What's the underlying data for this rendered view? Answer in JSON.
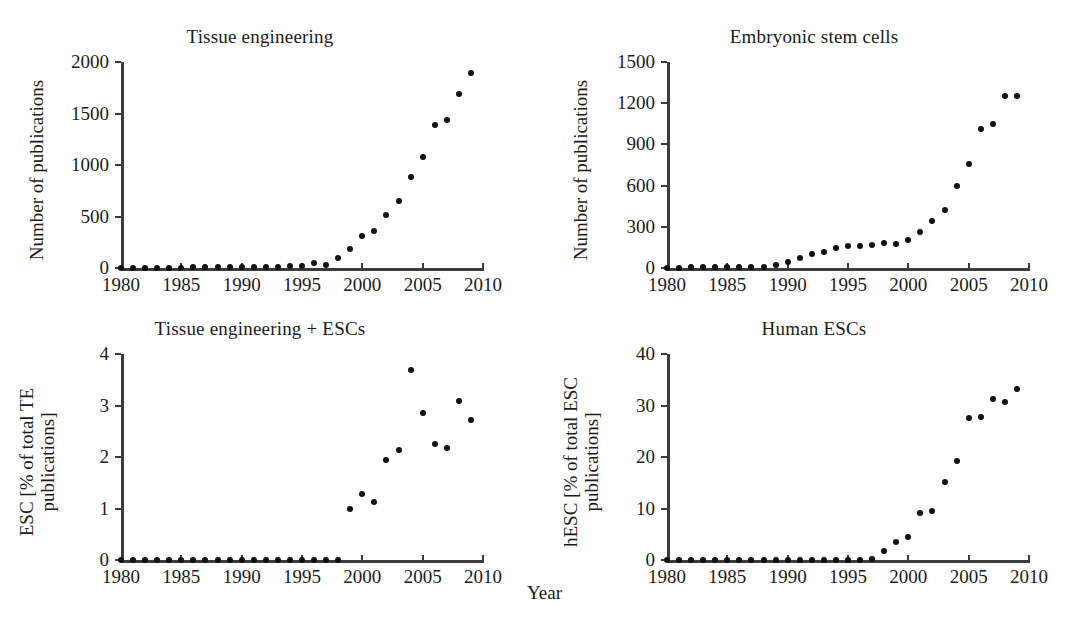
{
  "figure": {
    "shared_xlabel": "Year",
    "background_color": "#ffffff",
    "marker_color": "#111111",
    "axis_color": "#3b3b3b"
  },
  "chart_data": [
    {
      "type": "scatter",
      "panel": "top-left",
      "title": "Tissue engineering",
      "xlabel": "Year",
      "ylabel": "Number of publications",
      "xlim": [
        1980,
        2010
      ],
      "ylim": [
        0,
        2000
      ],
      "xticks": [
        1980,
        1985,
        1990,
        1995,
        2000,
        2005,
        2010
      ],
      "yticks": [
        0,
        500,
        1000,
        1500,
        2000
      ],
      "xticklabels": [
        "1980",
        "1985",
        "1990",
        "1995",
        "2000",
        "2005",
        "2010"
      ],
      "yticklabels": [
        "0",
        "500",
        "1000",
        "1500",
        "2000"
      ],
      "grid": false,
      "legend": false,
      "x": [
        1980,
        1981,
        1982,
        1983,
        1984,
        1985,
        1986,
        1987,
        1988,
        1989,
        1990,
        1991,
        1992,
        1993,
        1994,
        1995,
        1996,
        1997,
        1998,
        1999,
        2000,
        2001,
        2002,
        2003,
        2004,
        2005,
        2006,
        2007,
        2008,
        2009
      ],
      "y": [
        2,
        2,
        3,
        3,
        4,
        4,
        5,
        5,
        6,
        7,
        8,
        9,
        11,
        13,
        16,
        20,
        46,
        30,
        95,
        180,
        310,
        360,
        510,
        650,
        880,
        1080,
        1390,
        1440,
        1690,
        1890
      ]
    },
    {
      "type": "scatter",
      "panel": "top-right",
      "title": "Embryonic stem cells",
      "xlabel": "Year",
      "ylabel": "Number of publications",
      "xlim": [
        1980,
        2010
      ],
      "ylim": [
        0,
        1500
      ],
      "xticks": [
        1980,
        1985,
        1990,
        1995,
        2000,
        2005,
        2010
      ],
      "yticks": [
        0,
        300,
        600,
        900,
        1200,
        1500
      ],
      "xticklabels": [
        "1980",
        "1985",
        "1990",
        "1995",
        "2000",
        "2005",
        "2010"
      ],
      "yticklabels": [
        "0",
        "300",
        "600",
        "900",
        "1200",
        "1500"
      ],
      "grid": false,
      "legend": false,
      "x": [
        1980,
        1981,
        1982,
        1983,
        1984,
        1985,
        1986,
        1987,
        1988,
        1989,
        1990,
        1991,
        1992,
        1993,
        1994,
        1995,
        1996,
        1997,
        1998,
        1999,
        2000,
        2001,
        2002,
        2003,
        2004,
        2005,
        2006,
        2007,
        2008,
        2009
      ],
      "y": [
        3,
        3,
        4,
        4,
        5,
        5,
        6,
        7,
        8,
        25,
        45,
        75,
        100,
        115,
        148,
        160,
        162,
        170,
        180,
        178,
        205,
        265,
        340,
        425,
        600,
        760,
        1010,
        1045,
        1250,
        1255
      ]
    },
    {
      "type": "scatter",
      "panel": "bottom-left",
      "title": "Tissue engineering + ESCs",
      "xlabel": "Year",
      "ylabel": "ESC [% of total TE publications]",
      "xlim": [
        1980,
        2010
      ],
      "ylim": [
        0,
        4
      ],
      "xticks": [
        1980,
        1985,
        1990,
        1995,
        2000,
        2005,
        2010
      ],
      "yticks": [
        0,
        1,
        2,
        3,
        4
      ],
      "xticklabels": [
        "1980",
        "1985",
        "1990",
        "1995",
        "2000",
        "2005",
        "2010"
      ],
      "yticklabels": [
        "0",
        "1",
        "2",
        "3",
        "4"
      ],
      "grid": false,
      "legend": false,
      "x": [
        1980,
        1981,
        1982,
        1983,
        1984,
        1985,
        1986,
        1987,
        1988,
        1989,
        1990,
        1991,
        1992,
        1993,
        1994,
        1995,
        1996,
        1997,
        1998,
        1999,
        2000,
        2001,
        2002,
        2003,
        2004,
        2005,
        2006,
        2007,
        2008,
        2009
      ],
      "y": [
        0,
        0,
        0,
        0,
        0,
        0,
        0,
        0,
        0,
        0,
        0,
        0,
        0,
        0,
        0,
        0,
        0,
        0,
        0,
        1.0,
        1.29,
        1.12,
        1.95,
        2.13,
        3.68,
        2.86,
        2.26,
        2.17,
        3.08,
        2.72
      ]
    },
    {
      "type": "scatter",
      "panel": "bottom-right",
      "title": "Human ESCs",
      "xlabel": "Year",
      "ylabel": "hESC [% of total ESC publications]",
      "xlim": [
        1980,
        2010
      ],
      "ylim": [
        0,
        40
      ],
      "xticks": [
        1980,
        1985,
        1990,
        1995,
        2000,
        2005,
        2010
      ],
      "yticks": [
        0,
        10,
        20,
        30,
        40
      ],
      "xticklabels": [
        "1980",
        "1985",
        "1990",
        "1995",
        "2000",
        "2005",
        "2010"
      ],
      "yticklabels": [
        "0",
        "10",
        "20",
        "30",
        "40"
      ],
      "grid": false,
      "legend": false,
      "x": [
        1980,
        1981,
        1982,
        1983,
        1984,
        1985,
        1986,
        1987,
        1988,
        1989,
        1990,
        1991,
        1992,
        1993,
        1994,
        1995,
        1996,
        1997,
        1998,
        1999,
        2000,
        2001,
        2002,
        2003,
        2004,
        2005,
        2006,
        2007,
        2008,
        2009
      ],
      "y": [
        0,
        0,
        0,
        0,
        0,
        0,
        0,
        0,
        0,
        0,
        0,
        0,
        0,
        0,
        0,
        0,
        0,
        0.2,
        1.7,
        3.4,
        4.5,
        9.2,
        9.6,
        15.2,
        19.2,
        27.5,
        27.7,
        31.2,
        30.7,
        33.2
      ]
    }
  ],
  "panels": {
    "top_left": {
      "title": "Tissue engineering",
      "ylabel_lines": [
        "Number of publications"
      ]
    },
    "top_right": {
      "title": "Embryonic stem cells",
      "ylabel_lines": [
        "Number of publications"
      ]
    },
    "bottom_left": {
      "title": "Tissue engineering + ESCs",
      "ylabel_lines": [
        "ESC [% of total TE",
        "publications]"
      ]
    },
    "bottom_right": {
      "title": "Human ESCs",
      "ylabel_lines": [
        "hESC [% of total ESC",
        "publications]"
      ]
    }
  }
}
